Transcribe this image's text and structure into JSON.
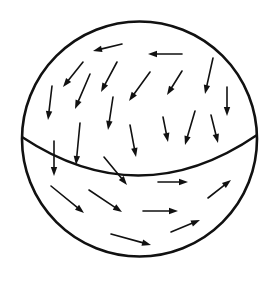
{
  "diagram": {
    "stroke_color": "#111111",
    "background": "#ffffff",
    "sphere": {
      "cx": 139.5,
      "cy": 139,
      "r": 117.5,
      "stroke_width": 2.6
    },
    "equator": {
      "path": "M 22 137 Q 140 215 257 135",
      "stroke_width": 2.4
    },
    "arrows": [
      {
        "x1": 122,
        "y1": 44,
        "x2": 93,
        "y2": 51
      },
      {
        "x1": 182,
        "y1": 54,
        "x2": 148,
        "y2": 54
      },
      {
        "x1": 83,
        "y1": 62,
        "x2": 63,
        "y2": 87
      },
      {
        "x1": 90,
        "y1": 74,
        "x2": 75,
        "y2": 109
      },
      {
        "x1": 117,
        "y1": 62,
        "x2": 101,
        "y2": 92
      },
      {
        "x1": 150,
        "y1": 72,
        "x2": 129,
        "y2": 101
      },
      {
        "x1": 182,
        "y1": 71,
        "x2": 167,
        "y2": 95
      },
      {
        "x1": 213,
        "y1": 58,
        "x2": 205,
        "y2": 94
      },
      {
        "x1": 52,
        "y1": 86,
        "x2": 48,
        "y2": 120
      },
      {
        "x1": 227,
        "y1": 87,
        "x2": 227,
        "y2": 116
      },
      {
        "x1": 113,
        "y1": 97,
        "x2": 108,
        "y2": 130
      },
      {
        "x1": 163,
        "y1": 117,
        "x2": 168,
        "y2": 142
      },
      {
        "x1": 195,
        "y1": 111,
        "x2": 185,
        "y2": 145
      },
      {
        "x1": 211,
        "y1": 115,
        "x2": 218,
        "y2": 143
      },
      {
        "x1": 80,
        "y1": 123,
        "x2": 76,
        "y2": 165
      },
      {
        "x1": 130,
        "y1": 125,
        "x2": 136,
        "y2": 157
      },
      {
        "x1": 54,
        "y1": 141,
        "x2": 54,
        "y2": 176
      },
      {
        "x1": 104,
        "y1": 157,
        "x2": 127,
        "y2": 185
      },
      {
        "x1": 158,
        "y1": 182,
        "x2": 188,
        "y2": 182
      },
      {
        "x1": 51,
        "y1": 186,
        "x2": 84,
        "y2": 213
      },
      {
        "x1": 89,
        "y1": 190,
        "x2": 122,
        "y2": 212
      },
      {
        "x1": 143,
        "y1": 211,
        "x2": 178,
        "y2": 211
      },
      {
        "x1": 208,
        "y1": 198,
        "x2": 231,
        "y2": 180
      },
      {
        "x1": 171,
        "y1": 232,
        "x2": 200,
        "y2": 220
      },
      {
        "x1": 111,
        "y1": 234,
        "x2": 151,
        "y2": 245
      }
    ],
    "arrow_stroke_width": 1.6,
    "arrowhead": {
      "length": 9,
      "half_width": 3.2
    }
  }
}
